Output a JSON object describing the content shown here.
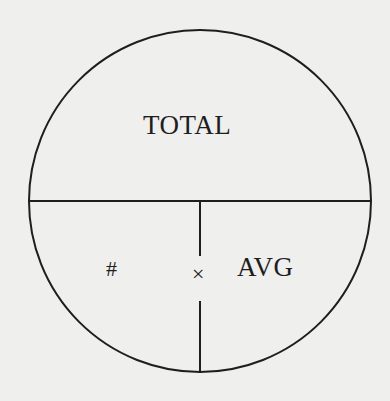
{
  "diagram": {
    "type": "formula-circle",
    "colors": {
      "background": "#efefee",
      "stroke": "#1e1e1e"
    },
    "top_section": {
      "label": "TOTAL"
    },
    "bottom_left_section": {
      "label": "#"
    },
    "operator": {
      "label": "×"
    },
    "bottom_right_section": {
      "label": "AVG"
    }
  }
}
